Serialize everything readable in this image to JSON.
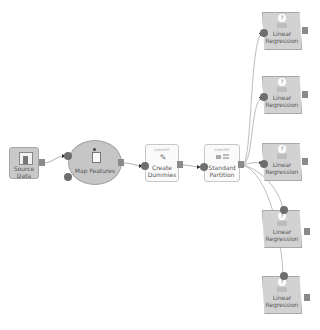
{
  "diagram": {
    "type": "workflow",
    "nodes": [
      {
        "id": "source",
        "label": "Source Data",
        "line1": "Source",
        "line2": "Data",
        "icon": "database-icon"
      },
      {
        "id": "map",
        "label": "Map Features",
        "icon": "person-map-icon"
      },
      {
        "id": "dummies",
        "label": "Create Dummies",
        "line1": "Create",
        "line2": "Dummies",
        "sub": "CONVERT",
        "icon": "pencil-icon"
      },
      {
        "id": "partition",
        "label": "Standard Partition",
        "line1": "Standard",
        "line2": "Partition",
        "sub": "CONVERT",
        "icon": "partition-icon"
      },
      {
        "id": "lr1",
        "label": "Linear Regression",
        "line1": "Linear",
        "line2": "Regression",
        "badge": "?",
        "icon": "regression-icon"
      },
      {
        "id": "lr2",
        "label": "Linear Regression",
        "line1": "Linear",
        "line2": "Regression",
        "badge": "?",
        "icon": "regression-icon"
      },
      {
        "id": "lr3",
        "label": "Linear Regression",
        "line1": "Linear",
        "line2": "Regression",
        "badge": "?",
        "icon": "regression-icon"
      },
      {
        "id": "lr4",
        "label": "Linear Regression",
        "line1": "Linear",
        "line2": "Regression",
        "badge": "?",
        "icon": "regression-icon"
      },
      {
        "id": "lr5",
        "label": "Linear Regression",
        "line1": "Linear",
        "line2": "Regression",
        "badge": "?",
        "icon": "regression-icon"
      }
    ],
    "edges": [
      {
        "from": "source",
        "to": "map"
      },
      {
        "from": "map",
        "to": "dummies"
      },
      {
        "from": "dummies",
        "to": "partition"
      },
      {
        "from": "partition",
        "to": "lr1"
      },
      {
        "from": "partition",
        "to": "lr2"
      },
      {
        "from": "partition",
        "to": "lr3"
      },
      {
        "from": "partition",
        "to": "lr4"
      },
      {
        "from": "partition",
        "to": "lr5"
      }
    ],
    "colors": {
      "node_fill": "#c9c9c9",
      "box_fill": "#fafafa",
      "port": "#6e6e6e",
      "wire": "#9a9a9a",
      "background": "#ffffff"
    }
  }
}
